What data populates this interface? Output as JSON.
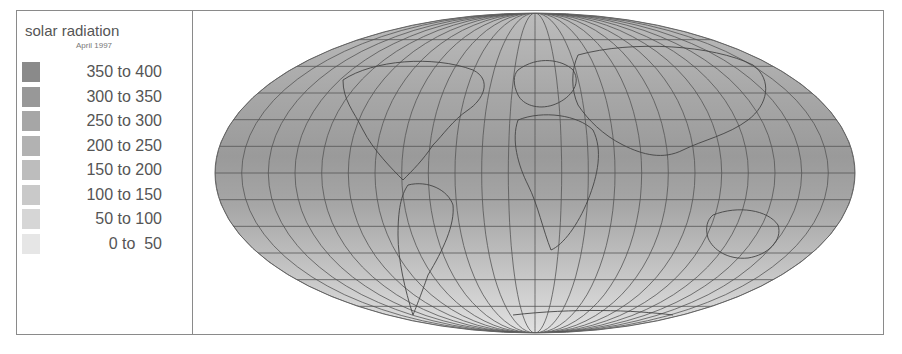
{
  "legend": {
    "title": "solar radiation",
    "subtitle": "April 1997",
    "items": [
      {
        "label": "350 to 400",
        "color": "#8a8a8a"
      },
      {
        "label": "300 to 350",
        "color": "#989898"
      },
      {
        "label": "250 to 300",
        "color": "#a6a6a6"
      },
      {
        "label": "200 to 250",
        "color": "#b2b2b2"
      },
      {
        "label": "150 to 200",
        "color": "#bdbdbd"
      },
      {
        "label": "100 to 150",
        "color": "#c9c9c9"
      },
      {
        "label": "50 to 100",
        "color": "#d6d6d6"
      },
      {
        "label": "0 to  50",
        "color": "#e6e6e6"
      }
    ]
  },
  "map": {
    "projection": "Mollweide",
    "graticule": "15-degree grid"
  }
}
